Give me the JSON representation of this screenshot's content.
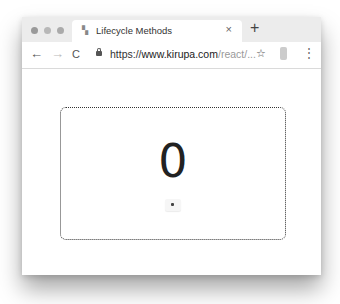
{
  "browser": {
    "tab": {
      "title": "Lifecycle Methods",
      "favicon": "kirupa-favicon",
      "close_label": "×"
    },
    "new_tab_label": "+",
    "toolbar": {
      "back_icon": "←",
      "forward_icon": "→",
      "reload_icon": "C",
      "url_scheme": "https://",
      "url_host": "www.kirupa.com",
      "url_path": "/react/...",
      "star_icon": "☆",
      "menu_icon": "⋮"
    }
  },
  "page": {
    "counter_value": "0",
    "button_label": ""
  }
}
